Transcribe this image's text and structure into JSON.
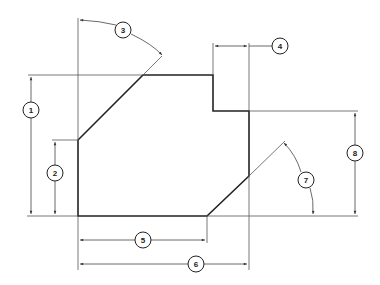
{
  "drawing": {
    "type": "dimensioned mechanical part outline",
    "colors": {
      "line": "#222222",
      "thin": "#555555",
      "background": "#ffffff"
    },
    "callouts": [
      {
        "id": "1",
        "label": "1",
        "meaning": "overall height (left)"
      },
      {
        "id": "2",
        "label": "2",
        "meaning": "height of lower-left vertical edge"
      },
      {
        "id": "3",
        "label": "3",
        "meaning": "angle of upper-left chamfer"
      },
      {
        "id": "4",
        "label": "4",
        "meaning": "width of upper-right step"
      },
      {
        "id": "5",
        "label": "5",
        "meaning": "bottom edge length"
      },
      {
        "id": "6",
        "label": "6",
        "meaning": "overall width"
      },
      {
        "id": "7",
        "label": "7",
        "meaning": "angle of lower-right chamfer"
      },
      {
        "id": "8",
        "label": "8",
        "meaning": "height of right side (step to bottom)"
      }
    ]
  }
}
